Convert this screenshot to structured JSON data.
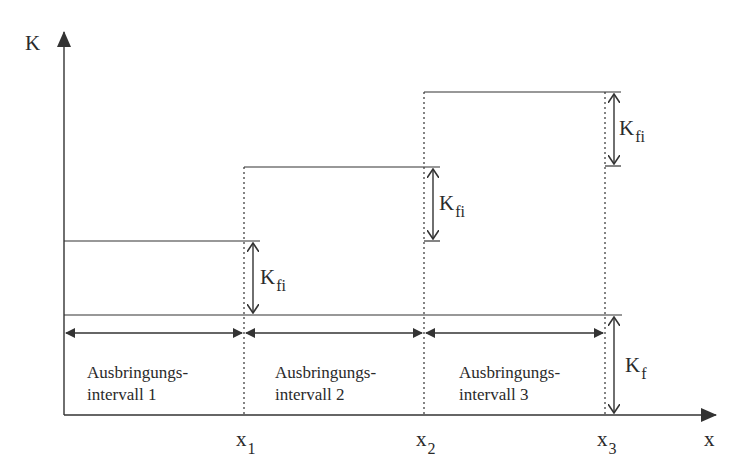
{
  "diagram": {
    "title": "",
    "y_axis_label": "K",
    "x_axis_label": "x",
    "x_ticks": [
      {
        "base": "x",
        "sub": "1"
      },
      {
        "base": "x",
        "sub": "2"
      },
      {
        "base": "x",
        "sub": "3"
      }
    ],
    "step_labels": [
      {
        "base": "K",
        "sub": "fi"
      },
      {
        "base": "K",
        "sub": "fi"
      },
      {
        "base": "K",
        "sub": "fi"
      }
    ],
    "fixed_cost_label": {
      "base": "K",
      "sub": "f"
    },
    "intervals": [
      {
        "line1": "Ausbringungs-",
        "line2": "intervall 1"
      },
      {
        "line1": "Ausbringungs-",
        "line2": "intervall 2"
      },
      {
        "line1": "Ausbringungs-",
        "line2": "intervall 3"
      }
    ],
    "colors": {
      "line": "#333333",
      "background": "#ffffff"
    }
  }
}
